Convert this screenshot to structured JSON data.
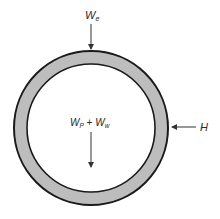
{
  "diagram": {
    "colors": {
      "ring_fill": "#bdbdbd",
      "stroke": "#1a1a1a",
      "arrow": "#333333"
    },
    "labels": {
      "earth_load": {
        "base": "W",
        "sub": "e"
      },
      "internal_load": {
        "base1": "W",
        "sub1": "P",
        "plus": " + ",
        "base2": "W",
        "sub2": "w"
      },
      "horizontal_load": "H"
    }
  }
}
